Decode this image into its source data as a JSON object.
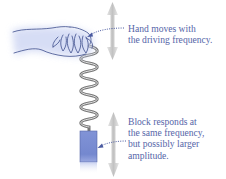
{
  "diagram": {
    "type": "driven-oscillator",
    "hand_annotation": {
      "lines": [
        "Hand moves with",
        "the driving frequency."
      ]
    },
    "block_annotation": {
      "lines": [
        "Block responds at",
        "the same frequency,",
        "but possibly larger",
        "amplitude."
      ]
    },
    "elements": {
      "hand": "hand-icon",
      "spring": "spring-icon",
      "block": "block-icon",
      "top_arrow": "double-arrow-vertical-icon",
      "bottom_arrow": "double-arrow-vertical-icon"
    },
    "colors": {
      "text": "#5565a8",
      "block": "#7d8fd4",
      "block_edge": "#4a5a9e",
      "arrow": "#c8c8c8",
      "dotted": "#4a5aa0",
      "hand_glow": "#dfe4f7",
      "hand_outline": "#3a4a8a",
      "spring": "#8c8c8c"
    }
  }
}
